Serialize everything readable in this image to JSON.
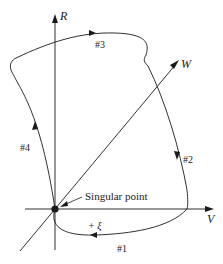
{
  "diagram": {
    "type": "phase-space trajectory",
    "axes": {
      "r": {
        "label": "R"
      },
      "v": {
        "label": "V"
      },
      "w": {
        "label": "W"
      }
    },
    "paths": [
      {
        "id": "1",
        "label": "#1"
      },
      {
        "id": "2",
        "label": "#2"
      },
      {
        "id": "3",
        "label": "#3"
      },
      {
        "id": "4",
        "label": "#4"
      }
    ],
    "singular_point": {
      "label": "Singular point"
    },
    "direction_label": "+ ξ",
    "colors": {
      "line": "#1a1a1a",
      "background": "#ffffff"
    }
  }
}
